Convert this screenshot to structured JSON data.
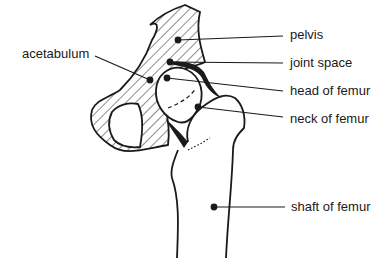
{
  "diagram": {
    "labels": {
      "acetabulum": "acetabulum",
      "pelvis": "pelvis",
      "joint_space": "joint space",
      "head_of_femur": "head of femur",
      "neck_of_femur": "neck of femur",
      "shaft_of_femur": "shaft of femur"
    },
    "colors": {
      "ink": "#1a1a1a",
      "background": "#ffffff"
    }
  }
}
